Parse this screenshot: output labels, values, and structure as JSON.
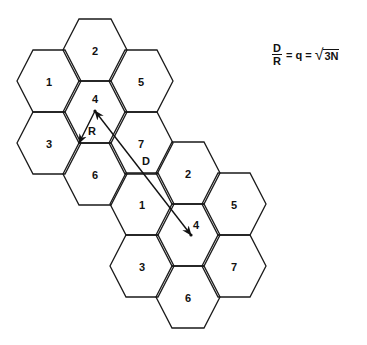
{
  "diagram": {
    "geometry": {
      "r": 32,
      "h": 31
    },
    "clusters": [
      {
        "name": "cluster-1",
        "cells": [
          {
            "label": "2",
            "cx": 95,
            "cy": 50
          },
          {
            "label": "1",
            "cx": 49,
            "cy": 81
          },
          {
            "label": "5",
            "cx": 141,
            "cy": 81
          },
          {
            "label": "4",
            "cx": 95,
            "cy": 112
          },
          {
            "label": "3",
            "cx": 49,
            "cy": 143
          },
          {
            "label": "7",
            "cx": 141,
            "cy": 143
          },
          {
            "label": "6",
            "cx": 95,
            "cy": 174
          }
        ]
      },
      {
        "name": "cluster-2",
        "cells": [
          {
            "label": "2",
            "cx": 188,
            "cy": 173
          },
          {
            "label": "1",
            "cx": 142,
            "cy": 204
          },
          {
            "label": "5",
            "cx": 234,
            "cy": 204
          },
          {
            "label": "4",
            "cx": 188,
            "cy": 235
          },
          {
            "label": "3",
            "cx": 142,
            "cy": 266
          },
          {
            "label": "7",
            "cx": 234,
            "cy": 266
          },
          {
            "label": "6",
            "cx": 188,
            "cy": 297
          }
        ]
      }
    ],
    "radius_arrow": {
      "label": "R",
      "from": [
        95,
        111
      ],
      "to": [
        79,
        143
      ]
    },
    "distance_arrow": {
      "label": "D",
      "from": [
        95,
        111
      ],
      "to": [
        191,
        235
      ]
    },
    "formula": {
      "numerator": "D",
      "denominator": "R",
      "middle": "= q =",
      "radicand": "3N"
    }
  }
}
